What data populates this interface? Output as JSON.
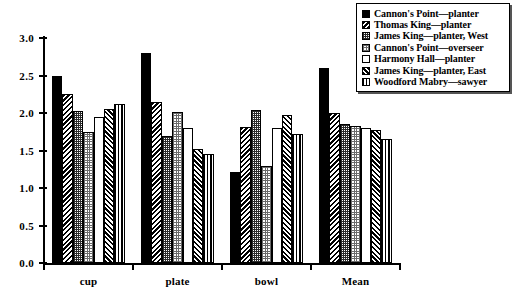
{
  "chart_data": {
    "type": "bar",
    "title": "",
    "subtitle": "",
    "xlabel": "",
    "ylabel": "",
    "categories": [
      "cup",
      "plate",
      "bowl",
      "Mean"
    ],
    "ylim": [
      0.0,
      3.0
    ],
    "ytick_values": [
      0.0,
      0.5,
      1.0,
      1.5,
      2.0,
      2.5,
      3.0
    ],
    "ytick_labels": [
      "0.0",
      "0.5",
      "1.0",
      "1.5",
      "2.0",
      "2.5",
      "3.0"
    ],
    "grid": false,
    "legend_position": "top-right",
    "series": [
      {
        "name": "Cannon's Point—planter",
        "pattern": "solid-black",
        "values": [
          2.5,
          2.8,
          1.22,
          2.6
        ]
      },
      {
        "name": "Thomas King—planter",
        "pattern": "diagonal-hatch-left",
        "values": [
          2.25,
          2.15,
          1.82,
          2.0
        ]
      },
      {
        "name": "James King—planter, West",
        "pattern": "dense-crosshatch",
        "values": [
          2.03,
          1.7,
          2.04,
          1.85
        ]
      },
      {
        "name": "Cannon's Point—overseer",
        "pattern": "light-crosshatch",
        "values": [
          1.75,
          2.02,
          1.3,
          1.83
        ]
      },
      {
        "name": "Harmony Hall—planter",
        "pattern": "white-empty",
        "values": [
          1.95,
          1.8,
          1.8,
          1.8
        ]
      },
      {
        "name": "James King—planter, East",
        "pattern": "diagonal-hatch-right",
        "values": [
          2.05,
          1.52,
          1.98,
          1.78
        ]
      },
      {
        "name": "Woodford Mabry—sawyer",
        "pattern": "vertical-lines",
        "values": [
          2.12,
          1.45,
          1.72,
          1.65
        ]
      }
    ]
  },
  "legend": {
    "items": [
      "Cannon's Point—planter",
      "Thomas King—planter",
      "James King—planter, West",
      "Cannon's Point—overseer",
      "Harmony Hall—planter",
      "James King—planter, East",
      "Woodford Mabry—sawyer"
    ]
  },
  "colors": {
    "ink": "#000000",
    "background": "#ffffff"
  }
}
